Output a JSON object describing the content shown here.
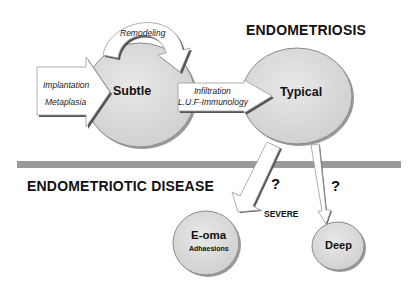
{
  "titles": {
    "top": "ENDOMETRIOSIS",
    "bottom": "ENDOMETRIOTIC DISEASE"
  },
  "nodes": {
    "subtle": "Subtle",
    "typical": "Typical",
    "eoma": "E-oma",
    "eoma_sub": "Adhaesions",
    "deep": "Deep"
  },
  "arrows": {
    "input_line1": "Implantation",
    "input_line2": "Metaplasia",
    "remodeling": "Remodeling",
    "transition_line1": "Infiltration",
    "transition_line2": "L.U.F-Immunology",
    "question_left": "?",
    "question_right": "?",
    "severe": "SEVERE"
  },
  "colors": {
    "ellipse_fill": "#dcdcdc",
    "ellipse_stroke": "#6e6e6e",
    "divider": "#9a9a9a",
    "arrow_fill": "#ffffff",
    "arrow_shadow": "#555555"
  }
}
